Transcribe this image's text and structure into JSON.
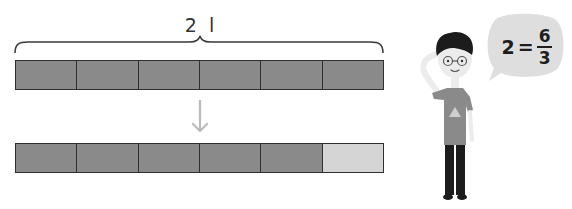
{
  "diagram": {
    "title_label": "2 l",
    "top_bar": {
      "segments": 6,
      "shaded": 6,
      "description": "2 liters divided into 6 equal parts"
    },
    "arrow": "down-arrow",
    "bottom_bar": {
      "segments": 6,
      "shaded": 5,
      "unshaded": 1
    },
    "speech_bubble": {
      "lhs": "2",
      "equals": "=",
      "numerator": "6",
      "denominator": "3"
    },
    "character": "boy-thinking-with-glasses"
  },
  "colors": {
    "shaded": "#8a8a8a",
    "unshaded": "#d5d5d5",
    "border": "#2f2f2f",
    "arrow": "#bbbbbb",
    "bubble": "#dedede",
    "hair": "#1c1c1c",
    "shirt": "#8a8a8a",
    "pants": "#1c1c1c",
    "skin": "#ececec"
  }
}
